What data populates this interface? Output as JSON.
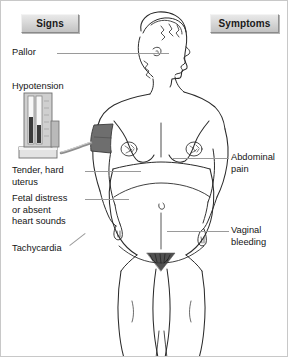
{
  "diagram": {
    "header": {
      "signs_label": "Signs",
      "symptoms_label": "Symptoms"
    },
    "signs": [
      {
        "id": "pallor",
        "label": "Pallor"
      },
      {
        "id": "hypotension",
        "label": "Hypotension"
      },
      {
        "id": "uterus",
        "label": "Tender, hard\nuterus"
      },
      {
        "id": "fetal",
        "label": "Fetal distress\nor absent\nheart sounds"
      },
      {
        "id": "tachycardia",
        "label": "Tachycardia"
      }
    ],
    "symptoms": [
      {
        "id": "abdominal",
        "label": "Abdominal\npain"
      },
      {
        "id": "vaginal",
        "label": "Vaginal\nbleeding"
      }
    ],
    "illustration": {
      "subject": "pregnant-woman-figure",
      "device": "sphygmomanometer",
      "cuff": "blood-pressure-cuff"
    },
    "colors": {
      "line": "#2b2b2b",
      "leader": "#9a9a9a",
      "cuff": "#6e6e6e",
      "button_face": "#d8d8d8",
      "border": "#c8c8c8",
      "background": "#ffffff"
    }
  }
}
